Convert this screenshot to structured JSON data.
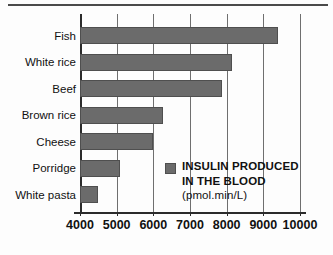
{
  "chart_data": {
    "type": "bar",
    "orientation": "horizontal",
    "title": "",
    "xlabel": "",
    "ylabel": "",
    "categories": [
      "Fish",
      "White rice",
      "Beef",
      "Brown rice",
      "Cheese",
      "Porridge",
      "White pasta"
    ],
    "values": [
      9400,
      8150,
      7880,
      6250,
      6000,
      5100,
      4500
    ],
    "series": [
      {
        "name": "INSULIN PRODUCED IN THE BLOOD (pmol.min/L)",
        "values": [
          9400,
          8150,
          7880,
          6250,
          6000,
          5100,
          4500
        ],
        "color": "#6b6b6b"
      }
    ],
    "xlim": [
      4000,
      10000
    ],
    "xticks": [
      4000,
      5000,
      6000,
      7000,
      8000,
      9000,
      10000
    ],
    "xtick_labels": [
      "4000",
      "5000",
      "6000",
      "7000",
      "8000",
      "9000",
      "10000"
    ],
    "grid": "vertical",
    "legend_position": "inside-lower-right"
  },
  "legend": {
    "line1": "INSULIN PRODUCED",
    "line2": "IN THE BLOOD",
    "line3": "(pmol.min/L)",
    "swatch_color": "#6b6b6b"
  },
  "colors": {
    "bar": "#6b6b6b",
    "bar_edge": "#4f4f4f",
    "axis": "#2b2b2b",
    "gridline": "#6f6f6f",
    "background": "#fdfdfd",
    "text": "#111111"
  }
}
